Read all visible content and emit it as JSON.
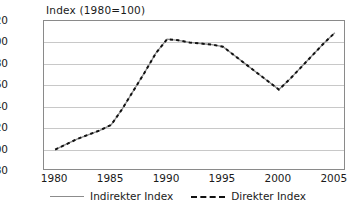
{
  "chart_data": {
    "type": "line",
    "title": "Index (1980=100)",
    "xlabel": "",
    "ylabel": "",
    "xlim": [
      1979,
      2006
    ],
    "ylim": [
      80,
      220
    ],
    "ytick_labels": [
      "220",
      "200",
      "180",
      "160",
      "140",
      "120",
      "100",
      "80"
    ],
    "ytick_values": [
      220,
      200,
      180,
      160,
      140,
      120,
      100,
      80
    ],
    "xtick_labels": [
      "1980",
      "1985",
      "1990",
      "1995",
      "2000",
      "2005"
    ],
    "xtick_values": [
      1980,
      1985,
      1990,
      1995,
      2000,
      2005
    ],
    "grid": "horizontal",
    "legend_position": "bottom",
    "x": [
      1980,
      1981,
      1982,
      1983,
      1984,
      1985,
      1986,
      1987,
      1988,
      1989,
      1990,
      1991,
      1992,
      1993,
      1994,
      1995,
      1996,
      1997,
      1998,
      1999,
      2000,
      2001,
      2002,
      2003,
      2004,
      2005
    ],
    "series": [
      {
        "name": "Indirekter Index",
        "style": "solid",
        "color": "#8c8c8c",
        "values": [
          100,
          105,
          110,
          114,
          118,
          123,
          138,
          155,
          172,
          190,
          203,
          202,
          200,
          199,
          198,
          196,
          188,
          180,
          172,
          164,
          156,
          166,
          177,
          188,
          199,
          209
        ]
      },
      {
        "name": "Direkter Index",
        "style": "dashed",
        "color": "#111111",
        "values": [
          100,
          105,
          110,
          114,
          118,
          123,
          138,
          155,
          172,
          190,
          203,
          202,
          200,
          199,
          198,
          196,
          188,
          180,
          172,
          164,
          156,
          166,
          177,
          188,
          199,
          209
        ]
      }
    ]
  },
  "legend": {
    "items": [
      {
        "label": "Indirekter Index"
      },
      {
        "label": "Direkter Index"
      }
    ]
  }
}
